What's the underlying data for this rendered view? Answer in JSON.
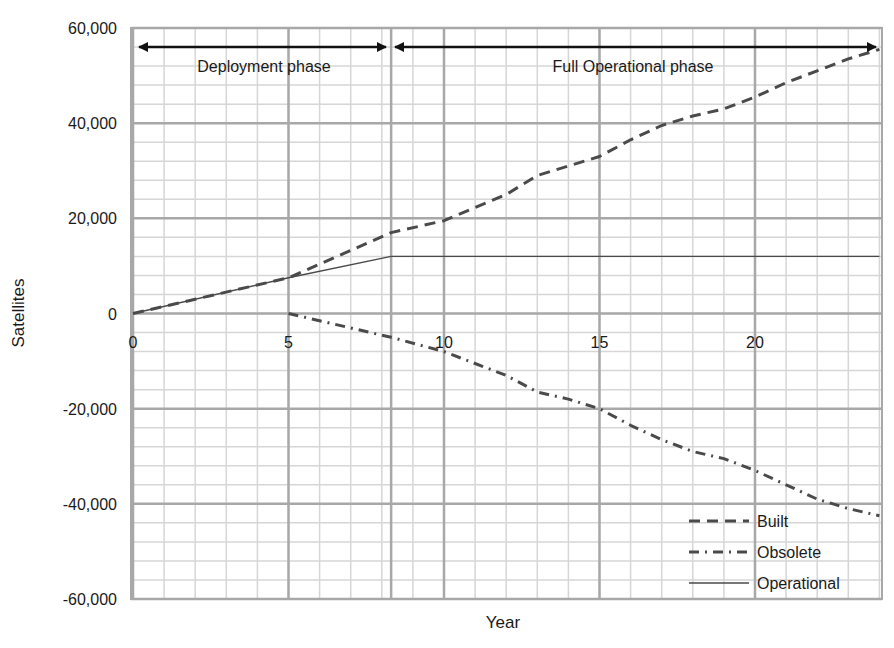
{
  "chart_data": {
    "type": "line",
    "title": "",
    "xlabel": "Year",
    "ylabel": "Satellites",
    "xlim": [
      0,
      24
    ],
    "ylim": [
      -60000,
      60000
    ],
    "x_ticks": [
      0,
      5,
      10,
      15,
      20
    ],
    "x_tick_labels": [
      "0",
      "5",
      "10",
      "15",
      "20"
    ],
    "y_ticks": [
      60000,
      40000,
      20000,
      0,
      -20000,
      -40000,
      -60000
    ],
    "y_tick_labels": [
      "60,000",
      "40,000",
      "20,000",
      "0",
      "-20,000",
      "-40,000",
      "-60,000"
    ],
    "grid": true,
    "grid_minor_x_step": 1,
    "grid_minor_y_step": 4000,
    "legend_position": "lower right",
    "phase_divider_x": 8.3,
    "annotations": [
      {
        "text": "Deployment phase",
        "x_start": 0,
        "x_end": 8.3,
        "y": 56000,
        "arrow": "double"
      },
      {
        "text": "Full Operational phase",
        "x_start": 8.3,
        "x_end": 24,
        "y": 56000,
        "arrow": "double"
      }
    ],
    "series": [
      {
        "name": "Built",
        "style": "dashed",
        "x": [
          0,
          5,
          8.3,
          10,
          12,
          13,
          14,
          15,
          16,
          17,
          18,
          19,
          20,
          21,
          22,
          23,
          24
        ],
        "values": [
          0,
          7500,
          17000,
          19500,
          25000,
          29000,
          31000,
          33000,
          36500,
          39500,
          41500,
          43000,
          45500,
          48500,
          51000,
          53500,
          55500
        ]
      },
      {
        "name": "Obsolete",
        "style": "dash-dot",
        "x": [
          5,
          8.3,
          10,
          12,
          13,
          14,
          15,
          16,
          17,
          18,
          19,
          20,
          21,
          22,
          23,
          24
        ],
        "values": [
          0,
          -5000,
          -8000,
          -13000,
          -16500,
          -18000,
          -20000,
          -23500,
          -26500,
          -29000,
          -30500,
          -33000,
          -36000,
          -39000,
          -41000,
          -42500
        ]
      },
      {
        "name": "Operational",
        "style": "solid-thin",
        "x": [
          0,
          5,
          8.3,
          24
        ],
        "values": [
          0,
          7500,
          12000,
          12000
        ]
      }
    ]
  },
  "colors": {
    "grid_major": "#a8a8a8",
    "grid_minor": "#d6d6d6",
    "series_line": "#4a4a4a",
    "arrow": "#111111",
    "text": "#1a1a1a"
  }
}
